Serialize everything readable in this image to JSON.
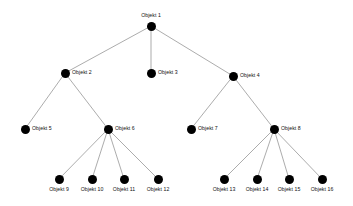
{
  "diagram": {
    "type": "tree",
    "title": "",
    "background_color": "#ffffff",
    "node_color": "#000000",
    "edge_color": "#888888",
    "nodes": [
      {
        "id": "n1",
        "label": "Objekt 1",
        "x": 151,
        "y": 26,
        "label_pos": "above",
        "level": 0
      },
      {
        "id": "n2",
        "label": "Objekt 2",
        "x": 65,
        "y": 73,
        "label_pos": "right",
        "level": 1
      },
      {
        "id": "n3",
        "label": "Objekt 3",
        "x": 151,
        "y": 73,
        "label_pos": "right",
        "level": 1
      },
      {
        "id": "n4",
        "label": "Objekt 4",
        "x": 233,
        "y": 76,
        "label_pos": "right",
        "level": 1
      },
      {
        "id": "n5",
        "label": "Objekt 5",
        "x": 25,
        "y": 129,
        "label_pos": "right",
        "level": 2
      },
      {
        "id": "n6",
        "label": "Objekt 6",
        "x": 108,
        "y": 129,
        "label_pos": "right",
        "level": 2
      },
      {
        "id": "n7",
        "label": "Objekt 7",
        "x": 191,
        "y": 129,
        "label_pos": "right",
        "level": 2
      },
      {
        "id": "n8",
        "label": "Objekt 8",
        "x": 274,
        "y": 129,
        "label_pos": "right",
        "level": 2
      },
      {
        "id": "n9",
        "label": "Objekt 9",
        "x": 59,
        "y": 179,
        "label_pos": "below",
        "level": 3
      },
      {
        "id": "n10",
        "label": "Objekt 10",
        "x": 92,
        "y": 179,
        "label_pos": "below",
        "level": 3
      },
      {
        "id": "n11",
        "label": "Objekt 11",
        "x": 124,
        "y": 179,
        "label_pos": "below",
        "level": 3
      },
      {
        "id": "n12",
        "label": "Objekt 12",
        "x": 158,
        "y": 179,
        "label_pos": "below",
        "level": 3
      },
      {
        "id": "n13",
        "label": "Objekt 13",
        "x": 224,
        "y": 179,
        "label_pos": "below",
        "level": 3
      },
      {
        "id": "n14",
        "label": "Objekt 14",
        "x": 257,
        "y": 179,
        "label_pos": "below",
        "level": 3
      },
      {
        "id": "n15",
        "label": "Objekt 15",
        "x": 289,
        "y": 179,
        "label_pos": "below",
        "level": 3
      },
      {
        "id": "n16",
        "label": "Objekt 16",
        "x": 322,
        "y": 179,
        "label_pos": "below",
        "level": 3
      }
    ],
    "edges": [
      {
        "from": "n1",
        "to": "n2"
      },
      {
        "from": "n1",
        "to": "n3"
      },
      {
        "from": "n1",
        "to": "n4"
      },
      {
        "from": "n2",
        "to": "n5"
      },
      {
        "from": "n2",
        "to": "n6"
      },
      {
        "from": "n4",
        "to": "n7"
      },
      {
        "from": "n4",
        "to": "n8"
      },
      {
        "from": "n6",
        "to": "n9"
      },
      {
        "from": "n6",
        "to": "n10"
      },
      {
        "from": "n6",
        "to": "n11"
      },
      {
        "from": "n6",
        "to": "n12"
      },
      {
        "from": "n8",
        "to": "n13"
      },
      {
        "from": "n8",
        "to": "n14"
      },
      {
        "from": "n8",
        "to": "n15"
      },
      {
        "from": "n8",
        "to": "n16"
      }
    ]
  }
}
